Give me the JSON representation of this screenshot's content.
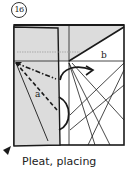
{
  "step": {
    "number": "16"
  },
  "labels": {
    "a": "a",
    "b": "b"
  },
  "caption": "Pleat, placing",
  "colors": {
    "paper_gray": "#dcdcdc",
    "line": "#1a1a1a",
    "background": "#ffffff"
  },
  "icons": {
    "pointer": "arrow-pointer-icon",
    "fold_arrow": "curved-arrow-icon"
  }
}
